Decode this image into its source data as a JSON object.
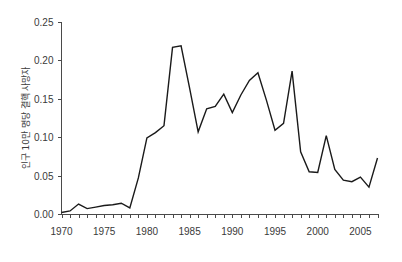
{
  "chart_data": {
    "type": "line",
    "title": "",
    "subtitle": "",
    "xlabel": "",
    "ylabel": "인구 10만 명당 결핵 사망자",
    "xlim": [
      1970,
      2007
    ],
    "ylim": [
      0.0,
      0.25
    ],
    "grid": false,
    "legend": null,
    "x_tick_labels": [
      "1970",
      "1975",
      "1980",
      "1985",
      "1990",
      "1995",
      "2000",
      "2005"
    ],
    "x_tick_values": [
      1970,
      1975,
      1980,
      1985,
      1990,
      1995,
      2000,
      2005
    ],
    "x_minor_tick_step": 1,
    "y_tick_labels": [
      "0.00",
      "0.05",
      "0.10",
      "0.15",
      "0.20",
      "0.25"
    ],
    "y_tick_values": [
      0.0,
      0.05,
      0.1,
      0.15,
      0.2,
      0.25
    ],
    "line_color": "#1a1a1a",
    "axis_color": "#4a4a4a",
    "background_color": "#ffffff",
    "series": [
      {
        "name": "인구 10만 명당 결핵 사망자",
        "x": [
          1970,
          1971,
          1972,
          1973,
          1974,
          1975,
          1976,
          1977,
          1978,
          1979,
          1980,
          1981,
          1982,
          1983,
          1984,
          1985,
          1986,
          1987,
          1988,
          1989,
          1990,
          1991,
          1992,
          1993,
          1994,
          1995,
          1996,
          1997,
          1998,
          1999,
          2000,
          2001,
          2002,
          2003,
          2004,
          2005,
          2006,
          2007
        ],
        "values": [
          0.002,
          0.004,
          0.013,
          0.007,
          0.009,
          0.011,
          0.012,
          0.014,
          0.008,
          0.047,
          0.099,
          0.106,
          0.115,
          0.217,
          0.219,
          0.164,
          0.107,
          0.137,
          0.14,
          0.156,
          0.132,
          0.155,
          0.174,
          0.184,
          0.148,
          0.109,
          0.118,
          0.186,
          0.081,
          0.055,
          0.054,
          0.102,
          0.058,
          0.044,
          0.042,
          0.048,
          0.035,
          0.073
        ]
      }
    ]
  },
  "axes": {
    "y_axis_title": "인구 10만 명당 결핵 사망자"
  }
}
